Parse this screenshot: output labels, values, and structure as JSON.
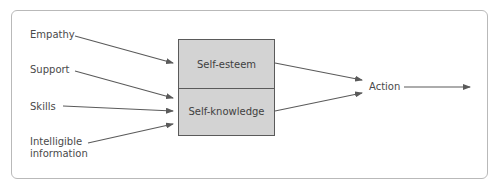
{
  "diagram": {
    "inputs": [
      {
        "label": "Empathy"
      },
      {
        "label": "Support"
      },
      {
        "label": "Skills"
      },
      {
        "label": "Intelligible information"
      }
    ],
    "input_label_lines": {
      "intelligible_line1": "Intelligible",
      "intelligible_line2": "information"
    },
    "central_box": {
      "top": "Self-esteem",
      "bottom": "Self-knowledge"
    },
    "output": "Action",
    "colors": {
      "box_fill": "#d3d3d3",
      "box_border": "#5a5a5a",
      "arrow": "#5a5a5a",
      "frame_border": "#b9b9b9",
      "text": "#4a4a4a"
    },
    "edges": [
      {
        "from": "Empathy",
        "to": "Self-esteem"
      },
      {
        "from": "Support",
        "to": "Self-knowledge"
      },
      {
        "from": "Skills",
        "to": "Self-knowledge"
      },
      {
        "from": "Intelligible information",
        "to": "Self-knowledge"
      },
      {
        "from": "Self-esteem",
        "to": "Action"
      },
      {
        "from": "Self-knowledge",
        "to": "Action"
      },
      {
        "from": "Action",
        "to": "(outward)"
      }
    ]
  }
}
